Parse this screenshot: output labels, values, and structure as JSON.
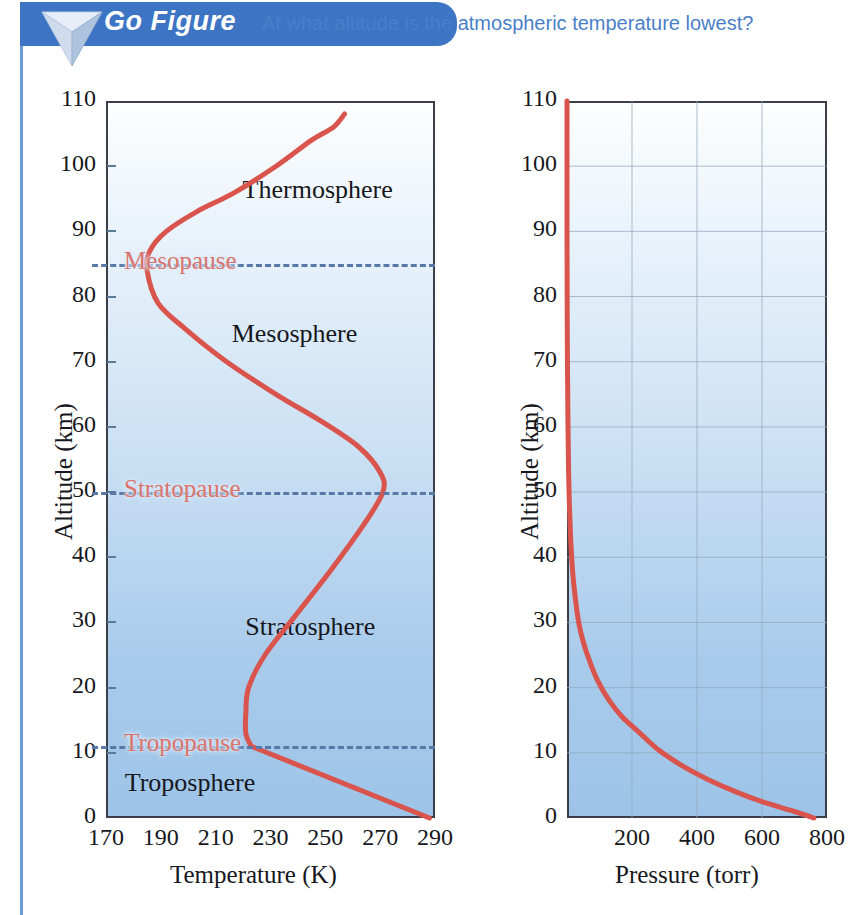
{
  "header": {
    "badge_label": "Go Figure",
    "badge_icon": "down-triangle-icon",
    "question": "At what altitude is the atmospheric temperature lowest?",
    "badge_color": "#3d74c4",
    "question_color": "#4a7fc8"
  },
  "chart_data": [
    {
      "id": "temperature-profile",
      "type": "line",
      "title": "",
      "xlabel": "Temperature (K)",
      "ylabel": "Altitude (km)",
      "xlim": [
        170,
        290
      ],
      "ylim": [
        0,
        110
      ],
      "xticks": [
        170,
        190,
        210,
        230,
        250,
        270,
        290
      ],
      "yticks": [
        0,
        10,
        20,
        30,
        40,
        50,
        60,
        70,
        80,
        90,
        100,
        110
      ],
      "grid": false,
      "legend": "none",
      "line_color": "#d9544c",
      "series": [
        {
          "name": "Atmospheric temperature",
          "x": [
            288,
            223,
            221,
            221,
            222,
            228,
            239,
            252,
            264,
            271,
            270,
            262,
            248,
            232,
            214,
            199,
            189,
            185,
            186,
            192,
            203,
            217,
            232,
            245,
            253,
            257
          ],
          "y": [
            0,
            11,
            13,
            16,
            20,
            25,
            31,
            38,
            45,
            50,
            53,
            57,
            61,
            65,
            70,
            75,
            79,
            84,
            87,
            90,
            93,
            96,
            100,
            104,
            106,
            108
          ]
        }
      ],
      "annotations": [
        {
          "text": "Thermosphere",
          "x": 249,
          "y": 96,
          "kind": "layer"
        },
        {
          "text": "Mesosphere",
          "x": 245,
          "y": 74,
          "kind": "layer"
        },
        {
          "text": "Stratosphere",
          "x": 250,
          "y": 29,
          "kind": "layer"
        },
        {
          "text": "Troposphere",
          "x": 206,
          "y": 5,
          "kind": "layer"
        },
        {
          "text": "Mesopause",
          "x": 200,
          "y": 85,
          "kind": "pause"
        },
        {
          "text": "Stratopause",
          "x": 204,
          "y": 50,
          "kind": "pause"
        },
        {
          "text": "Tropopause",
          "x": 198,
          "y": 11,
          "kind": "pause"
        }
      ],
      "boundary_lines": [
        {
          "label": "Mesopause",
          "altitude": 85
        },
        {
          "label": "Stratopause",
          "altitude": 50
        },
        {
          "label": "Tropopause",
          "altitude": 11
        }
      ]
    },
    {
      "id": "pressure-profile",
      "type": "line",
      "title": "",
      "xlabel": "Pressure (torr)",
      "ylabel": "Altitude (km)",
      "xlim": [
        0,
        800
      ],
      "ylim": [
        0,
        110
      ],
      "xticks": [
        200,
        400,
        600,
        800
      ],
      "yticks": [
        0,
        10,
        20,
        30,
        40,
        50,
        60,
        70,
        80,
        90,
        100,
        110
      ],
      "grid": true,
      "legend": "none",
      "line_color": "#d9544c",
      "series": [
        {
          "name": "Atmospheric pressure",
          "x": [
            760,
            700,
            600,
            520,
            430,
            355,
            280,
            225,
            170,
            130,
            95,
            70,
            50,
            36,
            25,
            17,
            11,
            7.5,
            5,
            3,
            1.7,
            0.9,
            0.4,
            0.15,
            0.05,
            0.01
          ],
          "y": [
            0,
            1,
            2.5,
            4,
            6,
            8,
            10.5,
            13,
            15.5,
            18,
            21,
            24,
            27,
            30,
            34,
            38,
            43,
            48,
            53,
            60,
            67,
            74,
            82,
            90,
            100,
            110
          ]
        }
      ],
      "annotations": []
    }
  ]
}
